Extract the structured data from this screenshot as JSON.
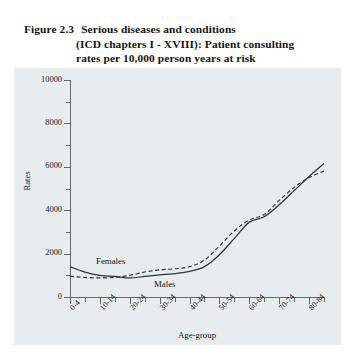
{
  "figure": {
    "number": "Figure 2.3",
    "title_line1": "Serious diseases and conditions",
    "title_line2": "(ICD chapters I - XVIII): Patient consulting",
    "title_line3": "rates per 10,000  person years at risk"
  },
  "chart_data": {
    "type": "line",
    "xlabel": "Age-group",
    "ylabel": "Rates",
    "ylim": [
      0,
      10000
    ],
    "ytick_step": 2000,
    "yminor_step": 1000,
    "ytick_labels": [
      "0",
      "2000",
      "4000",
      "6000",
      "8000",
      "10000"
    ],
    "ytick_values": [
      0,
      2000,
      4000,
      6000,
      8000,
      10000
    ],
    "grid": false,
    "legend_position": "inline-annotation",
    "categories": [
      "0-4",
      "5-9",
      "10-14",
      "15-19",
      "20-24",
      "25-29",
      "30-34",
      "35-39",
      "40-44",
      "45-49",
      "50-54",
      "55-59",
      "60-64",
      "65-69",
      "70-74",
      "75-79",
      "80-84",
      "85+"
    ],
    "xtick_labels_shown": [
      "0-4",
      "10-14",
      "20-24",
      "30-34",
      "40-44",
      "50-54",
      "60-64",
      "70-74",
      "80-84"
    ],
    "series": [
      {
        "name": "Females",
        "style": "solid",
        "values": [
          1400,
          1150,
          1000,
          950,
          880,
          950,
          1020,
          1080,
          1180,
          1400,
          1950,
          2700,
          3450,
          3700,
          4250,
          4900,
          5550,
          6150
        ]
      },
      {
        "name": "Males",
        "style": "dashed",
        "values": [
          950,
          900,
          880,
          900,
          1000,
          1150,
          1250,
          1300,
          1400,
          1700,
          2350,
          3050,
          3550,
          3800,
          4450,
          5050,
          5500,
          5800
        ]
      }
    ]
  },
  "series_tags": {
    "females": "Females",
    "males": "Males"
  },
  "colors": {
    "panel_background": "#e7edef",
    "page_background": "#ffffff",
    "axis": "#5d6a6e",
    "line": "#2d3538",
    "text": "#17191a"
  }
}
